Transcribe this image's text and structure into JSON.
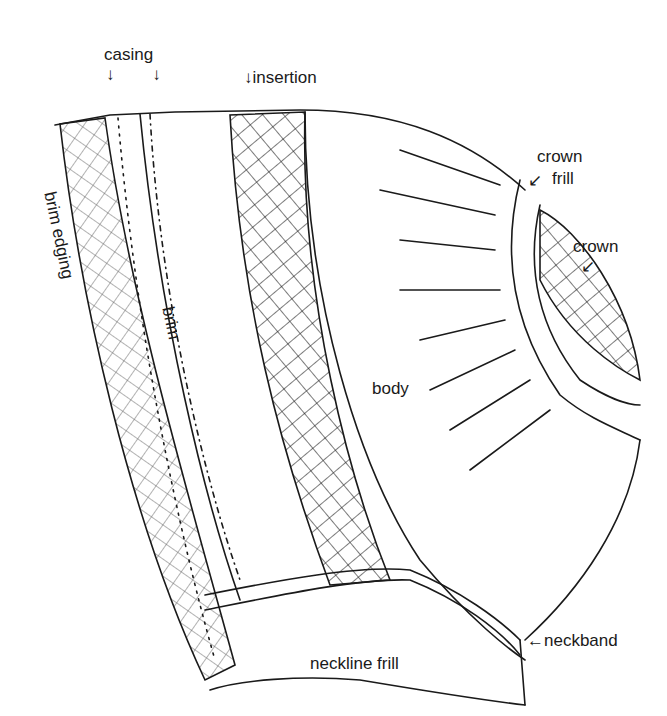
{
  "diagram": {
    "labels": {
      "casing": "casing",
      "casing_arrows": "↓        ↓",
      "insertion": "↓insertion",
      "crown_frill": "crown\nfrill",
      "crown_frill_line1": "crown",
      "crown_frill_line2": "frill",
      "crown_frill_arrow": "↙",
      "crown": "crown",
      "crown_arrow": "↙",
      "brim_edging": "brim edging",
      "brim": "brim",
      "body": "body",
      "neckband": "←neckband",
      "neckline_frill": "neckline frill"
    },
    "colors": {
      "ink": "#1a1a1a",
      "hatch": "#555555",
      "background": "#ffffff"
    }
  }
}
